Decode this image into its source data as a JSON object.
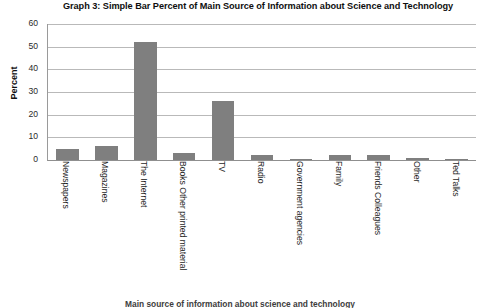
{
  "chart_data": {
    "type": "bar",
    "title": "Graph 3: Simple Bar Percent of Main Source of Information about Science and Technology",
    "xlabel": "",
    "ylabel": "Percent",
    "ylim": [
      0,
      60
    ],
    "yticks": [
      0,
      10,
      20,
      30,
      40,
      50,
      60
    ],
    "grid": true,
    "legend": "none",
    "bar_color": "#7f7f7f",
    "categories": [
      "Newspapers",
      "Magazines",
      "The Internet",
      "Books Other printed material",
      "TV",
      "Radio",
      "Government agencies",
      "Family",
      "Friends Colleagues",
      "Other",
      "Ted Talks"
    ],
    "values": [
      5,
      6,
      52,
      3,
      26,
      2,
      0,
      2,
      2,
      1,
      0
    ]
  },
  "footer": {
    "caption": "Main source of information about science and technology"
  }
}
